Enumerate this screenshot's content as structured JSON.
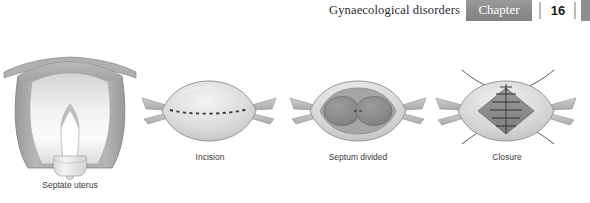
{
  "header": {
    "title": "Gynaecological disorders",
    "chapter_label": "Chapter",
    "chapter_number": "16",
    "banner_color": "#8e8e8e",
    "title_color": "#2b2b2b",
    "number_color": "#1a1a1a"
  },
  "figure": {
    "panels": [
      {
        "id": "septate-uterus",
        "caption": "Septate uterus",
        "description": "Coronal section of uterus with V-shaped midline septum dividing the cavity"
      },
      {
        "id": "incision",
        "caption": "Incision",
        "description": "Fundal view of septate uterus with dashed transverse incision line across the fundus"
      },
      {
        "id": "septum-divided",
        "caption": "Septum divided",
        "description": "Fundal view showing two dark hemicavities after the septum has been divided"
      },
      {
        "id": "closure",
        "caption": "Closure",
        "description": "Fundal view with diamond-shaped defect closed by interrupted sutures with trailing threads"
      }
    ],
    "colors": {
      "myometrium": "#a8a8a8",
      "myometrium_light": "#c2c2c2",
      "cavity_light": "#efefef",
      "cavity_dark": "#8a8a8a",
      "serosa_outline": "#7a7a7a",
      "suture": "#3a3a3a",
      "incision_dash": "#3c3c3c",
      "cervix": "#e8e8e8"
    }
  }
}
